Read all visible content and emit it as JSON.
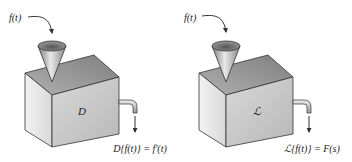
{
  "machines": [
    {
      "name": "derivative-machine",
      "input_label": "f(t)",
      "operator_label": "D",
      "output_label": "D{f(t)} = f′(t)"
    },
    {
      "name": "laplace-machine",
      "input_label": "f(t)",
      "operator_label": "ℒ",
      "output_label": "ℒ{f(t)} = F(s)"
    }
  ],
  "colors": {
    "box_front": "#c9c9c9",
    "box_side": "#e6e6e6",
    "box_top": "#9a9a9a",
    "outline": "#333333"
  }
}
